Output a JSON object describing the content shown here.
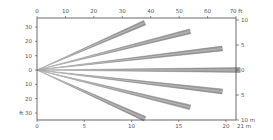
{
  "chart_data": {
    "type": "line",
    "title": "",
    "xlabel": "m",
    "ylabel": "ft",
    "top_axis": {
      "unit": "ft",
      "ticks": [
        "0",
        "10",
        "20",
        "30",
        "40",
        "50",
        "60",
        "70"
      ],
      "end_label": "70 ft",
      "range": [
        0,
        70
      ]
    },
    "bottom_axis": {
      "unit": "m",
      "ticks": [
        "0",
        "5",
        "10",
        "15",
        "20"
      ],
      "end_label": "21 m",
      "range": [
        0,
        21
      ]
    },
    "left_axis": {
      "unit": "ft",
      "ticks": [
        "30",
        "20",
        "10",
        "0",
        "10",
        "20",
        "30"
      ],
      "bottom_label": "ft 30",
      "range": [
        -35,
        35
      ]
    },
    "right_axis": {
      "unit": "m",
      "ticks": [
        "10",
        "5",
        "0",
        "5",
        "10"
      ],
      "end_label": "10 m",
      "range": [
        -10.7,
        10.7
      ]
    },
    "grid": false,
    "legend": null,
    "origin": {
      "x_m": 0,
      "y_ft": 0
    },
    "series": [
      {
        "name": "beam-1",
        "end_x_m": 11.4,
        "end_y_ft": 33
      },
      {
        "name": "beam-2",
        "end_x_m": 16.2,
        "end_y_ft": 27
      },
      {
        "name": "beam-3",
        "end_x_m": 19.6,
        "end_y_ft": 15
      },
      {
        "name": "beam-4",
        "end_x_m": 21.5,
        "end_y_ft": 0
      },
      {
        "name": "beam-5",
        "end_x_m": 19.6,
        "end_y_ft": -15
      },
      {
        "name": "beam-6",
        "end_x_m": 16.2,
        "end_y_ft": -26
      },
      {
        "name": "beam-7",
        "end_x_m": 11.4,
        "end_y_ft": -34
      }
    ],
    "colors": {
      "beam": "#8a8a8a",
      "beam_edge": "#6e6e6e",
      "axis": "#444444",
      "text": "#555555"
    }
  }
}
